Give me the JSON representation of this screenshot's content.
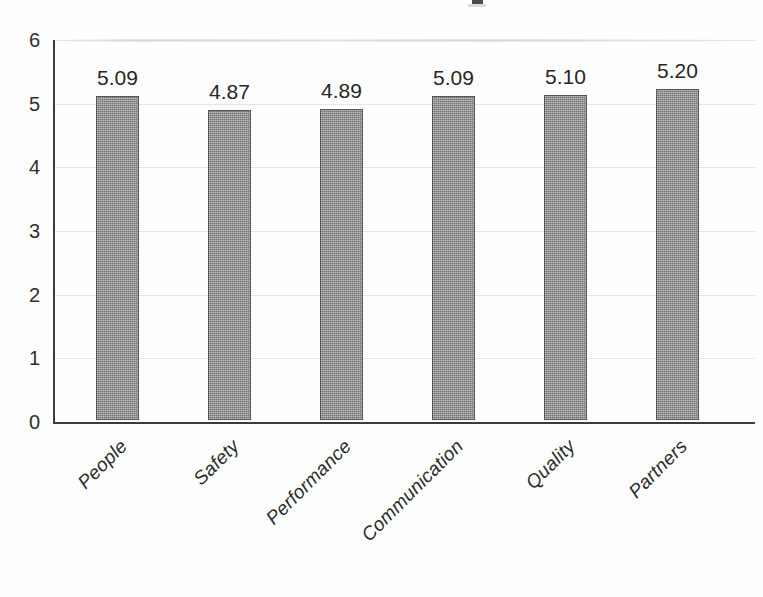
{
  "chart_data": {
    "type": "bar",
    "title": "",
    "xlabel": "",
    "ylabel": "",
    "categories": [
      "People",
      "Safety",
      "Performance",
      "Communication",
      "Quality",
      "Partners"
    ],
    "values": [
      5.09,
      4.87,
      4.89,
      5.09,
      5.1,
      5.2
    ],
    "value_labels": [
      "5.09",
      "4.87",
      "4.89",
      "5.09",
      "5.10",
      "5.20"
    ],
    "ylim": [
      0,
      6
    ],
    "yticks": [
      6,
      5,
      4,
      3,
      2,
      1,
      0
    ],
    "ytick_labels": [
      "6",
      "5",
      "4",
      "3",
      "2",
      "1",
      "0"
    ],
    "grid": true,
    "legend": false,
    "legend_position": "none",
    "series": [
      {
        "name": "Score",
        "values": [
          5.09,
          4.87,
          4.89,
          5.09,
          5.1,
          5.2
        ],
        "color": "#8e8e8e",
        "border_color": "#555555"
      }
    ]
  },
  "colors": {
    "background": "#fefefe",
    "bar_fill": "#8e8e8e",
    "bar_border": "#555555",
    "axis": "#3d3d3d",
    "grid": "#cecece",
    "text": "#2b2b2b"
  }
}
